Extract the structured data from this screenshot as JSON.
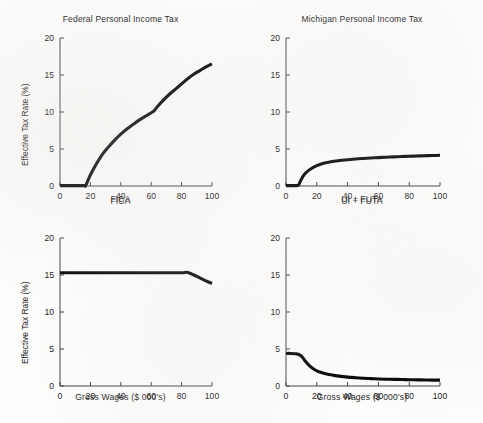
{
  "figure": {
    "background_color": "#fdfdfc",
    "curve_color": "#000000",
    "axis_color": "#3c3c3c",
    "panel_count": 4
  },
  "chart_data": [
    {
      "id": "federal-personal-income-tax",
      "type": "line",
      "title": "Federal Personal Income Tax",
      "xlabel": "FICA",
      "ylabel": "Effective Tax Rate (%)",
      "xlim": [
        0,
        100
      ],
      "ylim": [
        0,
        20
      ],
      "xticks": [
        0,
        20,
        40,
        60,
        80,
        100
      ],
      "yticks": [
        0,
        5,
        10,
        15,
        20
      ],
      "xticklabels": [
        "0",
        "20",
        "40",
        "60",
        "80",
        "100"
      ],
      "yticklabels": [
        "0",
        "5",
        "10",
        "15",
        "20"
      ],
      "grid": false,
      "legend": "none",
      "series": [
        {
          "name": "Federal effective rate",
          "x": [
            0,
            4,
            8,
            12,
            16,
            17,
            20,
            24,
            28,
            32,
            36,
            40,
            44,
            48,
            52,
            56,
            60,
            62,
            64,
            68,
            72,
            76,
            80,
            84,
            88,
            92,
            96,
            100
          ],
          "y": [
            0.05,
            0.05,
            0.05,
            0.05,
            0.05,
            0.1,
            1.5,
            3.0,
            4.3,
            5.3,
            6.2,
            7.0,
            7.7,
            8.3,
            8.9,
            9.4,
            9.9,
            10.2,
            10.7,
            11.6,
            12.4,
            13.1,
            13.8,
            14.5,
            15.1,
            15.6,
            16.1,
            16.5
          ]
        }
      ]
    },
    {
      "id": "michigan-personal-income-tax",
      "type": "line",
      "title": "Michigan Personal Income Tax",
      "xlabel": "UI + FUTA",
      "ylabel": "",
      "xlim": [
        0,
        100
      ],
      "ylim": [
        0,
        20
      ],
      "xticks": [
        0,
        20,
        40,
        60,
        80,
        100
      ],
      "yticks": [
        0,
        5,
        10,
        15,
        20
      ],
      "xticklabels": [
        "0",
        "20",
        "40",
        "60",
        "80",
        "100"
      ],
      "yticklabels": [
        "0",
        "5",
        "10",
        "15",
        "20"
      ],
      "grid": false,
      "legend": "none",
      "series": [
        {
          "name": "Michigan effective rate",
          "x": [
            0,
            3,
            6,
            8,
            9,
            11,
            13,
            16,
            20,
            25,
            30,
            35,
            40,
            45,
            50,
            55,
            60,
            65,
            70,
            75,
            80,
            85,
            90,
            95,
            100
          ],
          "y": [
            0.05,
            0.05,
            0.05,
            0.1,
            0.5,
            1.3,
            1.8,
            2.3,
            2.75,
            3.1,
            3.3,
            3.45,
            3.55,
            3.65,
            3.72,
            3.78,
            3.84,
            3.89,
            3.94,
            3.98,
            4.02,
            4.06,
            4.09,
            4.12,
            4.15
          ]
        }
      ]
    },
    {
      "id": "fica",
      "type": "line",
      "title": "FICA",
      "xlabel": "Gross Wages ($ 000's)",
      "ylabel": "Effective Tax Rate (%)",
      "xlim": [
        0,
        100
      ],
      "ylim": [
        0,
        20
      ],
      "xticks": [
        0,
        20,
        40,
        60,
        80,
        100
      ],
      "yticks": [
        0,
        5,
        10,
        15,
        20
      ],
      "xticklabels": [
        "0",
        "20",
        "40",
        "60",
        "80",
        "100"
      ],
      "yticklabels": [
        "0",
        "5",
        "10",
        "15",
        "20"
      ],
      "grid": false,
      "legend": "none",
      "series": [
        {
          "name": "FICA effective rate",
          "x": [
            0,
            10,
            20,
            30,
            40,
            50,
            60,
            70,
            80,
            84,
            88,
            92,
            96,
            100
          ],
          "y": [
            15.3,
            15.3,
            15.3,
            15.3,
            15.3,
            15.3,
            15.3,
            15.3,
            15.3,
            15.35,
            15.0,
            14.6,
            14.2,
            13.85
          ]
        }
      ]
    },
    {
      "id": "ui-futa",
      "type": "line",
      "title": "UI + FUTA",
      "xlabel": "Gross Wages ($ 000's)",
      "ylabel": "",
      "xlim": [
        0,
        100
      ],
      "ylim": [
        0,
        20
      ],
      "xticks": [
        0,
        20,
        40,
        60,
        80,
        100
      ],
      "yticks": [
        0,
        5,
        10,
        15,
        20
      ],
      "xticklabels": [
        "0",
        "20",
        "40",
        "60",
        "80",
        "100"
      ],
      "yticklabels": [
        "0",
        "5",
        "10",
        "15",
        "20"
      ],
      "grid": false,
      "legend": "none",
      "series": [
        {
          "name": "UI + FUTA effective rate",
          "x": [
            0,
            3,
            6,
            8,
            10,
            12,
            14,
            16,
            18,
            20,
            24,
            28,
            32,
            36,
            40,
            45,
            50,
            55,
            60,
            65,
            70,
            75,
            80,
            85,
            90,
            95,
            100
          ],
          "y": [
            4.4,
            4.4,
            4.35,
            4.3,
            4.05,
            3.5,
            3.0,
            2.6,
            2.3,
            2.05,
            1.75,
            1.55,
            1.4,
            1.3,
            1.2,
            1.12,
            1.05,
            1.0,
            0.95,
            0.92,
            0.9,
            0.88,
            0.85,
            0.83,
            0.82,
            0.8,
            0.8
          ]
        }
      ]
    }
  ]
}
